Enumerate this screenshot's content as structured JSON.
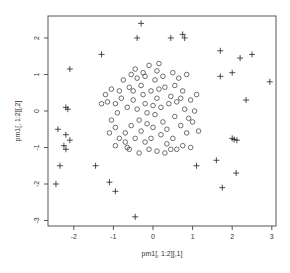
{
  "chart_data": {
    "type": "scatter",
    "title": "",
    "xlabel": "pm1[, 1:2][,1]",
    "ylabel": "pm1[, 1:2][,2]",
    "xlim": [
      -2.65,
      3.1
    ],
    "ylim": [
      -3.15,
      2.6
    ],
    "xticks": [
      -2,
      -1,
      0,
      1,
      2,
      3
    ],
    "yticks": [
      -3,
      -2,
      -1,
      0,
      1,
      2
    ],
    "xtick_labels": [
      "-2",
      "-1",
      "0",
      "1",
      "2",
      "3"
    ],
    "ytick_labels": [
      "-3",
      "-2",
      "-1",
      "0",
      "1",
      "2"
    ],
    "grid": false,
    "legend": null,
    "series": [
      {
        "name": "inner",
        "marker": "circle",
        "points": [
          [
            -1.3,
            0.2
          ],
          [
            -1.15,
            0.25
          ],
          [
            -1.2,
            0.45
          ],
          [
            -1.05,
            0.6
          ],
          [
            -0.95,
            0.2
          ],
          [
            -0.9,
            -0.05
          ],
          [
            -1.05,
            -0.25
          ],
          [
            -0.95,
            -0.45
          ],
          [
            -1.1,
            -0.6
          ],
          [
            -0.85,
            -0.75
          ],
          [
            -0.7,
            -0.85
          ],
          [
            -0.95,
            -0.95
          ],
          [
            -0.75,
            0.85
          ],
          [
            -0.6,
            0.65
          ],
          [
            -0.55,
            1.0
          ],
          [
            -0.45,
            1.15
          ],
          [
            -0.4,
            0.9
          ],
          [
            -0.3,
            0.7
          ],
          [
            -0.25,
            0.45
          ],
          [
            -0.5,
            0.3
          ],
          [
            -0.65,
            0.1
          ],
          [
            -0.4,
            0.05
          ],
          [
            -0.2,
            0.2
          ],
          [
            -0.15,
            -0.05
          ],
          [
            -0.35,
            -0.25
          ],
          [
            -0.55,
            -0.4
          ],
          [
            -0.3,
            -0.55
          ],
          [
            -0.45,
            -0.75
          ],
          [
            -0.2,
            -0.85
          ],
          [
            -0.6,
            -1.05
          ],
          [
            -0.35,
            -1.15
          ],
          [
            -0.1,
            -1.05
          ],
          [
            -0.05,
            0.55
          ],
          [
            0.05,
            0.85
          ],
          [
            0.1,
            1.1
          ],
          [
            -0.1,
            1.25
          ],
          [
            0.15,
            1.3
          ],
          [
            0.25,
            0.95
          ],
          [
            0.3,
            0.65
          ],
          [
            0.1,
            0.35
          ],
          [
            0.2,
            0.1
          ],
          [
            0.05,
            -0.1
          ],
          [
            0.25,
            -0.3
          ],
          [
            0.0,
            -0.45
          ],
          [
            0.2,
            -0.65
          ],
          [
            0.35,
            -0.9
          ],
          [
            0.1,
            -1.1
          ],
          [
            0.3,
            -1.15
          ],
          [
            0.45,
            0.4
          ],
          [
            0.55,
            0.7
          ],
          [
            0.5,
            1.05
          ],
          [
            0.65,
            0.9
          ],
          [
            0.75,
            0.55
          ],
          [
            0.6,
            0.25
          ],
          [
            0.8,
            0.05
          ],
          [
            0.55,
            -0.15
          ],
          [
            0.7,
            -0.4
          ],
          [
            0.85,
            -0.6
          ],
          [
            0.5,
            -0.75
          ],
          [
            0.75,
            -0.95
          ],
          [
            0.95,
            -1.0
          ],
          [
            0.95,
            0.3
          ],
          [
            1.05,
            0.0
          ],
          [
            1.0,
            -0.3
          ],
          [
            1.15,
            -0.55
          ],
          [
            0.85,
            1.0
          ],
          [
            -0.8,
            0.35
          ],
          [
            -0.7,
            -0.6
          ],
          [
            -0.2,
            0.95
          ],
          [
            0.4,
            0.2
          ],
          [
            0.35,
            -0.5
          ],
          [
            -0.05,
            -0.75
          ],
          [
            0.6,
            -1.05
          ],
          [
            -0.5,
            0.55
          ],
          [
            0.15,
            0.6
          ],
          [
            0.9,
            -0.2
          ],
          [
            -0.85,
            0.55
          ],
          [
            0.7,
            0.35
          ],
          [
            -0.15,
            -0.35
          ],
          [
            0.45,
            -1.05
          ],
          [
            -0.65,
            -1.0
          ],
          [
            1.1,
            0.45
          ],
          [
            -0.25,
            1.05
          ],
          [
            0.0,
            0.15
          ]
        ]
      },
      {
        "name": "outer",
        "marker": "cross",
        "points": [
          [
            -0.3,
            2.4
          ],
          [
            -0.4,
            2.0
          ],
          [
            0.45,
            2.0
          ],
          [
            0.75,
            2.1
          ],
          [
            0.8,
            2.0
          ],
          [
            -1.3,
            1.55
          ],
          [
            -2.1,
            1.15
          ],
          [
            -2.2,
            0.1
          ],
          [
            -2.15,
            0.05
          ],
          [
            -2.4,
            -0.5
          ],
          [
            -2.2,
            -0.65
          ],
          [
            -2.1,
            -0.8
          ],
          [
            -2.25,
            -0.95
          ],
          [
            -2.2,
            -1.05
          ],
          [
            -2.35,
            -1.5
          ],
          [
            -1.45,
            -1.5
          ],
          [
            -1.1,
            -1.95
          ],
          [
            -2.45,
            -2.0
          ],
          [
            -0.95,
            -2.2
          ],
          [
            -0.45,
            -2.9
          ],
          [
            1.1,
            -1.5
          ],
          [
            1.6,
            -1.35
          ],
          [
            2.1,
            -1.7
          ],
          [
            1.75,
            -2.1
          ],
          [
            2.0,
            -0.75
          ],
          [
            2.05,
            -0.78
          ],
          [
            2.12,
            -0.8
          ],
          [
            1.7,
            1.65
          ],
          [
            2.2,
            1.45
          ],
          [
            2.5,
            1.55
          ],
          [
            2.0,
            1.05
          ],
          [
            1.7,
            0.95
          ],
          [
            2.35,
            0.3
          ],
          [
            2.95,
            0.8
          ]
        ]
      }
    ]
  }
}
